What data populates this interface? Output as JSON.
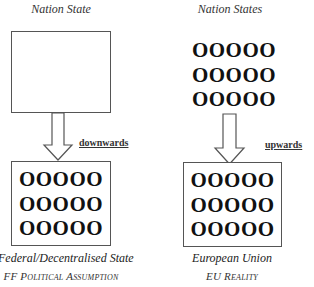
{
  "left": {
    "top_label": "Nation State",
    "direction_label": "downwards",
    "bottom_rows": [
      "OOOOO",
      "OOOOO",
      "OOOOO"
    ],
    "bottom_label": "Federal/Decentralised State",
    "caption": "FF Political Assumption"
  },
  "right": {
    "top_label": "Nation States",
    "top_rows": [
      "OOOOO",
      "OOOOO",
      "OOOOO"
    ],
    "direction_label": "upwards",
    "bottom_rows": [
      "OOOOO",
      "OOOOO",
      "OOOOO"
    ],
    "bottom_label": "European Union",
    "caption": "EU Reality"
  },
  "colors": {
    "stroke": "#555555",
    "text": "#111111"
  }
}
